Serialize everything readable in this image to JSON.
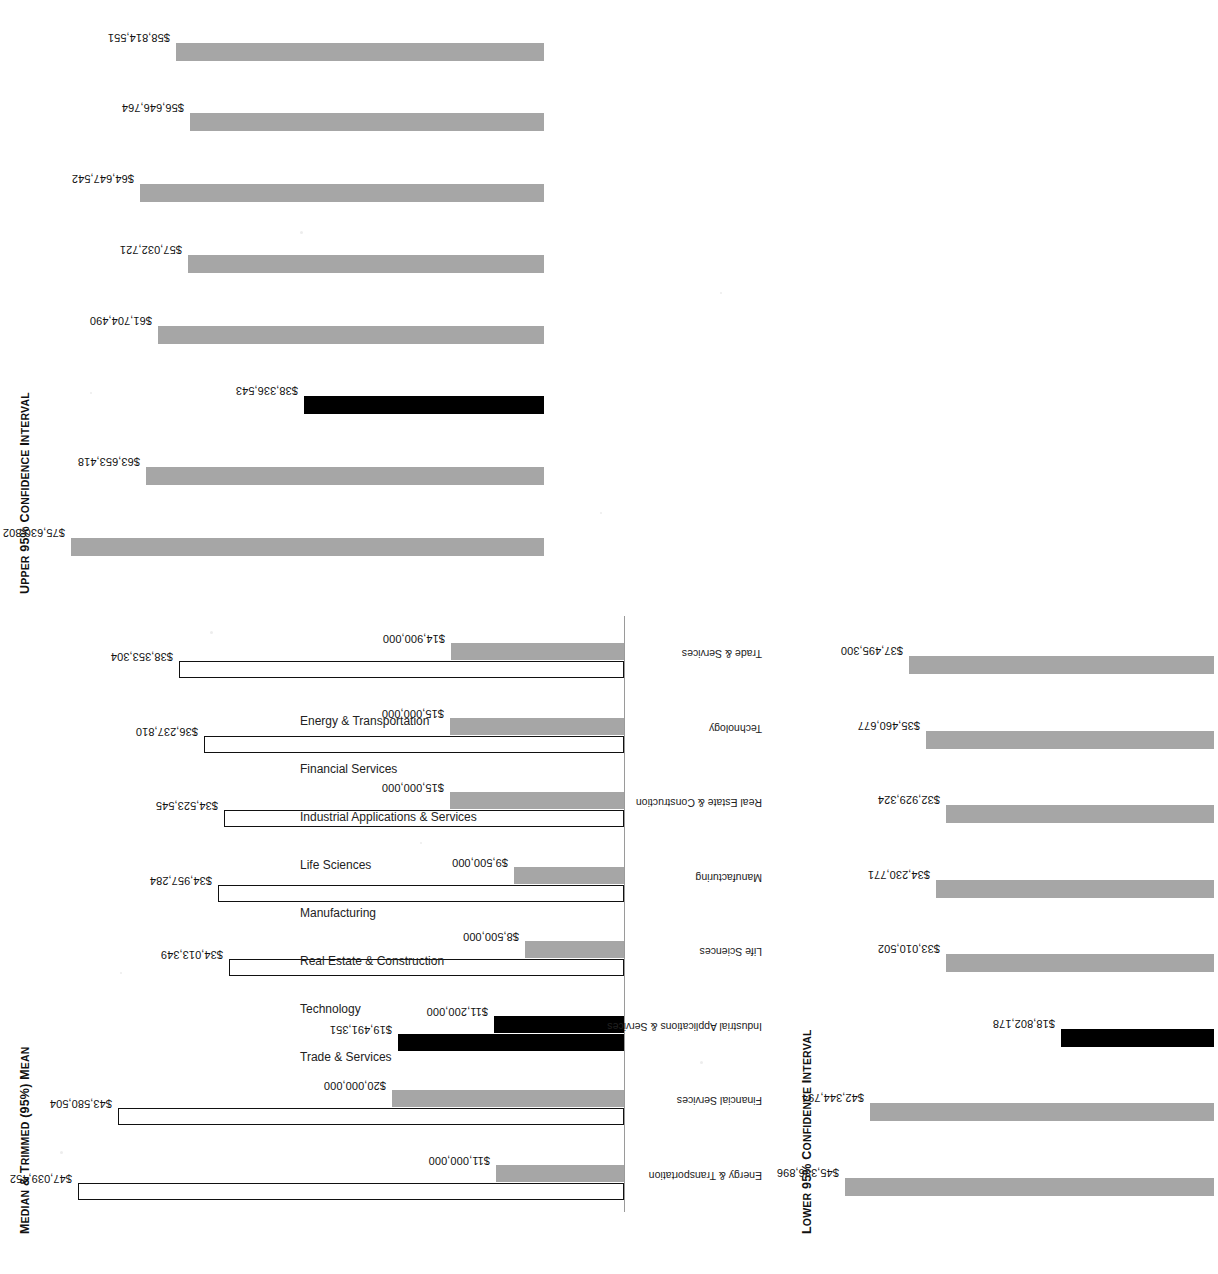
{
  "page": {
    "background": "#ffffff",
    "bar_colors": {
      "gray": "#a6a6a6",
      "highlight": "#000000",
      "hollow_fill": "#ffffff",
      "hollow_stroke": "#111111"
    },
    "highlight_category": "Industrial Applications & Services"
  },
  "categories": [
    "Energy & Transportation",
    "Financial Services",
    "Industrial Applications & Services",
    "Life Sciences",
    "Manufacturing",
    "Real Estate & Construction",
    "Technology",
    "Trade & Services"
  ],
  "charts": {
    "median_trimmed_mean": {
      "title_main": "Median & Trimmed (95%) Mean",
      "title_parts": [
        "M",
        "EDIAN",
        " & T",
        "RIMMED",
        " (95%) M",
        "EAN"
      ],
      "trimmed_mean_labels": [
        "$47,039,452",
        "$43,580,504",
        "$19,491,351",
        "$34,013,349",
        "$34,957,284",
        "$34,523,545",
        "$36,237,810",
        "$38,353,304"
      ],
      "median_labels": [
        "$11,000,000",
        "$20,000,000",
        "$11,200,000",
        "$8,500,000",
        "$9,500,000",
        "$15,000,000",
        "$15,000,000",
        "$14,900,000"
      ]
    },
    "lower_ci": {
      "title_main": "Lower 95% Confidence Interval",
      "title_parts": [
        "L",
        "OWER",
        " 95% C",
        "ONFIDENCE",
        " I",
        "NTERVAL"
      ],
      "value_labels": [
        "$45,386,896",
        "$42,344,794",
        "$18,802,178",
        "$33,010,502",
        "$34,230,771",
        "$32,929,324",
        "$35,460,677",
        "$37,495,300"
      ]
    },
    "upper_ci": {
      "title_main": "Upper 95% Confidence Interval",
      "title_parts": [
        "U",
        "PPER",
        " 95% C",
        "ONFIDENCE",
        " I",
        "NTERVAL"
      ],
      "value_labels": [
        "$75,630,802",
        "$63,653,418",
        "$38,336,543",
        "$61,704,490",
        "$57,032,721",
        "$64,647,542",
        "$56,646,764",
        "$58,814,551"
      ]
    }
  },
  "chart_data": [
    {
      "type": "bar",
      "id": "median-trimmed-mean",
      "title": "MEDIAN & TRIMMED (95%) MEAN",
      "xlabel": "",
      "ylabel": "",
      "grid": false,
      "legend": null,
      "orientation": "vertical",
      "categories": [
        "Energy & Transportation",
        "Financial Services",
        "Industrial Applications & Services",
        "Life Sciences",
        "Manufacturing",
        "Real Estate & Construction",
        "Technology",
        "Trade & Services"
      ],
      "series": [
        {
          "name": "Trimmed (95%) Mean",
          "style": "hollow-outline",
          "values": [
            47039452,
            43580504,
            19491351,
            34013349,
            34957284,
            34523545,
            36237810,
            38353304
          ],
          "labels": [
            "$47,039,452",
            "$43,580,504",
            "$19,491,351",
            "$34,013,349",
            "$34,957,284",
            "$34,523,545",
            "$36,237,810",
            "$38,353,304"
          ]
        },
        {
          "name": "Median",
          "style": "filled-gray",
          "values": [
            11000000,
            20000000,
            11200000,
            8500000,
            9500000,
            15000000,
            15000000,
            14900000
          ],
          "labels": [
            "$11,000,000",
            "$20,000,000",
            "$11,200,000",
            "$8,500,000",
            "$9,500,000",
            "$15,000,000",
            "$15,000,000",
            "$14,900,000"
          ]
        }
      ],
      "ylim": [
        0,
        50000000
      ],
      "highlighted_category": "Industrial Applications & Services"
    },
    {
      "type": "bar",
      "id": "lower-95-confidence-interval",
      "title": "LOWER 95% CONFIDENCE INTERVAL",
      "xlabel": "",
      "ylabel": "",
      "grid": false,
      "legend": null,
      "orientation": "vertical",
      "categories": [
        "Energy & Transportation",
        "Financial Services",
        "Industrial Applications & Services",
        "Life Sciences",
        "Manufacturing",
        "Real Estate & Construction",
        "Technology",
        "Trade & Services"
      ],
      "values": [
        45386896,
        42344794,
        18802178,
        33010502,
        34230771,
        32929324,
        35460677,
        37495300
      ],
      "labels": [
        "$45,386,896",
        "$42,344,794",
        "$18,802,178",
        "$33,010,502",
        "$34,230,771",
        "$32,929,324",
        "$35,460,677",
        "$37,495,300"
      ],
      "ylim": [
        0,
        48000000
      ],
      "highlighted_category": "Industrial Applications & Services"
    },
    {
      "type": "bar",
      "id": "upper-95-confidence-interval",
      "title": "UPPER 95% CONFIDENCE INTERVAL",
      "xlabel": "",
      "ylabel": "",
      "grid": false,
      "legend": null,
      "orientation": "vertical",
      "categories": [
        "Energy & Transportation",
        "Financial Services",
        "Industrial Applications & Services",
        "Life Sciences",
        "Manufacturing",
        "Real Estate & Construction",
        "Technology",
        "Trade & Services"
      ],
      "values": [
        75630802,
        63653418,
        38336543,
        61704490,
        57032721,
        64647542,
        56646764,
        58814551
      ],
      "labels": [
        "$75,630,802",
        "$63,653,418",
        "$38,336,543",
        "$61,704,490",
        "$57,032,721",
        "$64,647,542",
        "$56,646,764",
        "$58,814,551"
      ],
      "ylim": [
        0,
        80000000
      ],
      "highlighted_category": "Industrial Applications & Services"
    }
  ]
}
